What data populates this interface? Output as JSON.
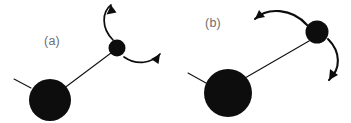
{
  "figure": {
    "background_color": "#ffffff",
    "ink_color": "#0d0d0d",
    "label_color": "#6e6e6e",
    "width": 351,
    "height": 123,
    "panels": [
      {
        "id": "a",
        "label": "(a)",
        "label_x": 52,
        "label_y": 45,
        "atoms": [
          {
            "name": "large-atom",
            "cx": 50,
            "cy": 100,
            "r": 21
          },
          {
            "name": "small-atom",
            "cx": 117,
            "cy": 48,
            "r": 8.5
          }
        ],
        "bond": {
          "x1": 63,
          "y1": 89,
          "x2": 111,
          "y2": 53
        },
        "stub": {
          "x1": 31,
          "y1": 88,
          "x2": 14,
          "y2": 79
        },
        "arrows": [
          {
            "name": "upper-rotation-arrow",
            "path": "M 113 40 C 101 28 102 12 111 5",
            "head": "M 111 5 L 106.5 14.5 L 116.5 12.5 Z",
            "stroke_width": 1.7
          },
          {
            "name": "lower-rotation-arrow",
            "path": "M 124 57 C 137 66 152 63 160 54",
            "head": "M 160 54 L 151 59 L 158.5 64 Z",
            "stroke_width": 1.7
          }
        ]
      },
      {
        "id": "b",
        "label": "(b)",
        "label_x": 213,
        "label_y": 27,
        "atoms": [
          {
            "name": "large-atom",
            "cx": 228,
            "cy": 93,
            "r": 24
          },
          {
            "name": "small-atom",
            "cx": 317,
            "cy": 32,
            "r": 11.5
          }
        ],
        "bond": {
          "x1": 245,
          "y1": 78,
          "x2": 309,
          "y2": 41
        },
        "stub": {
          "x1": 206,
          "y1": 83,
          "x2": 188,
          "y2": 73
        },
        "arrows": [
          {
            "name": "upper-rotation-arrow",
            "path": "M 307 25 C 292 8 267 7 255 19",
            "head": "M 255 19 L 265 17 L 259 10 Z",
            "stroke_width": 2.1
          },
          {
            "name": "right-rotation-arrow",
            "path": "M 328 39 C 341 52 341 69 329 80",
            "head": "M 329 80 L 338 75 L 330 69 Z",
            "stroke_width": 2.1
          }
        ]
      }
    ]
  }
}
